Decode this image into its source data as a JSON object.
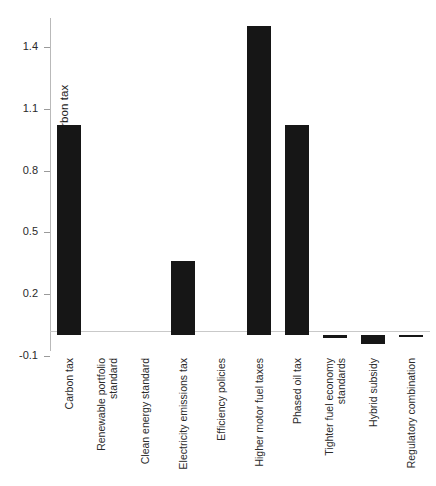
{
  "chart_data": {
    "type": "bar",
    "title": "",
    "xlabel": "",
    "ylabel": "PDV of revenue relative to carbon tax",
    "ylim": [
      -0.1,
      1.55
    ],
    "yticks": [
      1.4,
      1.1,
      0.8,
      0.5,
      0.2,
      -0.1
    ],
    "ytick_labels": [
      "1.4",
      "1.1",
      "0.8",
      "0.5",
      "0.2",
      "-0.1"
    ],
    "grid": false,
    "legend": null,
    "bar_color": "#161616",
    "categories": [
      "Carbon tax",
      "Renewable portfolio standard",
      "Clean energy standard",
      "Electricity emissions tax",
      "Efficiency policies",
      "Higher motor fuel taxes",
      "Phased oil tax",
      "Tighter fuel economy standards",
      "Hybrid subsidy",
      "Regulatory combination"
    ],
    "category_label_lines": [
      [
        "Carbon tax"
      ],
      [
        "Renewable portfolio",
        "standard"
      ],
      [
        "Clean energy standard"
      ],
      [
        "Electricity emissions tax"
      ],
      [
        "Efficiency policies"
      ],
      [
        "Higher motor fuel taxes"
      ],
      [
        "Phased oil tax"
      ],
      [
        "Tighter fuel economy",
        "standards"
      ],
      [
        "Hybrid subsidy"
      ],
      [
        "Regulatory combination"
      ]
    ],
    "values": [
      1.02,
      0.0,
      0.0,
      0.36,
      0.0,
      1.5,
      1.02,
      -0.015,
      -0.04,
      -0.01
    ]
  }
}
